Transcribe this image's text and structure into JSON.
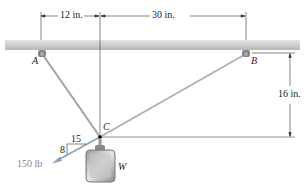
{
  "figure": {
    "points": {
      "A": "A",
      "B": "B",
      "C": "C"
    },
    "weight_label": "W",
    "dimensions": {
      "left_span": "12 in.",
      "right_span": "30 in.",
      "vertical": "16 in."
    },
    "force": {
      "magnitude_label": "150 lb",
      "slope_horizontal": "15",
      "slope_vertical": "8"
    },
    "colors": {
      "beam": "#c9c9c9",
      "cable": "#9a9a9a",
      "force_arrow": "#8a9db5",
      "dimension_line": "#333333"
    }
  }
}
